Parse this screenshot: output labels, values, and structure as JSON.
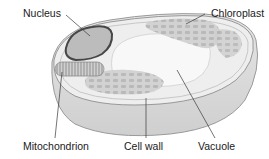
{
  "labels": {
    "nucleus": "Nucleus",
    "chloroplast": "Chloroplast",
    "mitochondrion": "Mitochondrion",
    "cell_wall": "Cell wall",
    "vacuole": "Vacuole"
  },
  "colors": {
    "background": "#ffffff",
    "cell_outer": "#dcdcdc",
    "cell_top": "#efefef",
    "vacuole": "#f7f7f7",
    "nucleus_fill": "#b9b9b9",
    "nucleus_border": "#4a4a4a",
    "organelle": "#b5b5b5",
    "leader_line": "#333333"
  }
}
